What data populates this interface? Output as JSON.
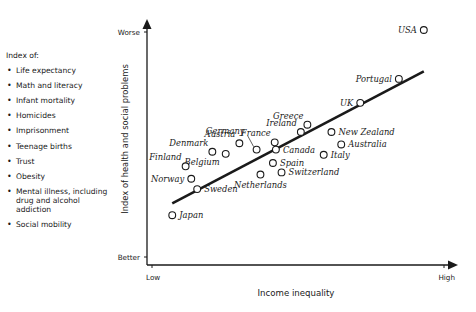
{
  "legend": {
    "title": "Index of:",
    "items": [
      "Life expectancy",
      "Math and literacy",
      "Infant mortality",
      "Homicides",
      "Imprisonment",
      "Teenage births",
      "Trust",
      "Obesity",
      "Mental illness, including drug and alcohol addiction",
      "Social mobility"
    ]
  },
  "axes": {
    "y_label": "Index of health and social problems",
    "y_top": "Worse",
    "y_bottom": "Better",
    "x_label": "Income inequality",
    "x_left": "Low",
    "x_right": "High"
  },
  "colors": {
    "ink": "#1a1a1a",
    "background": "#ffffff"
  },
  "chart_data": {
    "type": "scatter",
    "title": "",
    "xlabel": "Income inequality",
    "ylabel": "Index of health and social problems",
    "x_range_labels": [
      "Low",
      "High"
    ],
    "y_range_labels": [
      "Better",
      "Worse"
    ],
    "units_note": "x and y in relative 0-100 scale (0 = Low/Better, 100 = High/Worse)",
    "xlim": [
      0,
      100
    ],
    "ylim": [
      0,
      100
    ],
    "grid": false,
    "trendline": {
      "x": [
        8.5,
        93.2
      ],
      "y": [
        26.2,
        82.4
      ]
    },
    "points": [
      {
        "country": "USA",
        "x": 93.2,
        "y": 100.0,
        "label_pos": "left"
      },
      {
        "country": "Portugal",
        "x": 84.8,
        "y": 79.2,
        "label_pos": "left"
      },
      {
        "country": "UK",
        "x": 71.8,
        "y": 69.0,
        "label_pos": "left"
      },
      {
        "country": "Greece",
        "x": 54.0,
        "y": 59.7,
        "label_pos": "top-left"
      },
      {
        "country": "Ireland",
        "x": 51.8,
        "y": 56.6,
        "label_pos": "top-left"
      },
      {
        "country": "New Zealand",
        "x": 62.1,
        "y": 56.6,
        "label_pos": "right"
      },
      {
        "country": "Australia",
        "x": 65.4,
        "y": 51.3,
        "label_pos": "right"
      },
      {
        "country": "Italy",
        "x": 59.5,
        "y": 46.9,
        "label_pos": "right"
      },
      {
        "country": "France",
        "x": 43.0,
        "y": 52.2,
        "label_pos": "top-left"
      },
      {
        "country": "Canada",
        "x": 43.4,
        "y": 49.1,
        "label_pos": "right"
      },
      {
        "country": "Spain",
        "x": 42.4,
        "y": 43.4,
        "label_pos": "right"
      },
      {
        "country": "Switzerland",
        "x": 45.3,
        "y": 39.4,
        "label_pos": "right"
      },
      {
        "country": "Netherlands",
        "x": 38.2,
        "y": 38.5,
        "label_pos": "bottom"
      },
      {
        "country": "Germany",
        "x": 36.9,
        "y": 49.1,
        "label_pos": "top-left-leader"
      },
      {
        "country": "Austria",
        "x": 31.1,
        "y": 51.8,
        "label_pos": "top-left"
      },
      {
        "country": "Denmark",
        "x": 22.0,
        "y": 48.2,
        "label_pos": "top-left"
      },
      {
        "country": "Belgium",
        "x": 26.5,
        "y": 47.3,
        "label_pos": "bottom-left"
      },
      {
        "country": "Finland",
        "x": 13.0,
        "y": 42.0,
        "label_pos": "top-left"
      },
      {
        "country": "Norway",
        "x": 14.9,
        "y": 36.7,
        "label_pos": "left"
      },
      {
        "country": "Sweden",
        "x": 16.9,
        "y": 32.3,
        "label_pos": "right"
      },
      {
        "country": "Japan",
        "x": 8.5,
        "y": 21.2,
        "label_pos": "right"
      }
    ]
  }
}
